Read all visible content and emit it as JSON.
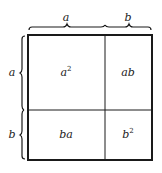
{
  "diagram": {
    "type": "area-model",
    "top_labels": [
      {
        "text": "a"
      },
      {
        "text": "b"
      }
    ],
    "side_labels": [
      {
        "text": "a"
      },
      {
        "text": "b"
      }
    ],
    "cells": [
      {
        "base": "a",
        "sup": "2"
      },
      {
        "base": "ab",
        "sup": ""
      },
      {
        "base": "ba",
        "sup": ""
      },
      {
        "base": "b",
        "sup": "2"
      }
    ],
    "colors": {
      "stroke": "#1a1a1a",
      "text": "#222222",
      "background": "#ffffff"
    }
  }
}
